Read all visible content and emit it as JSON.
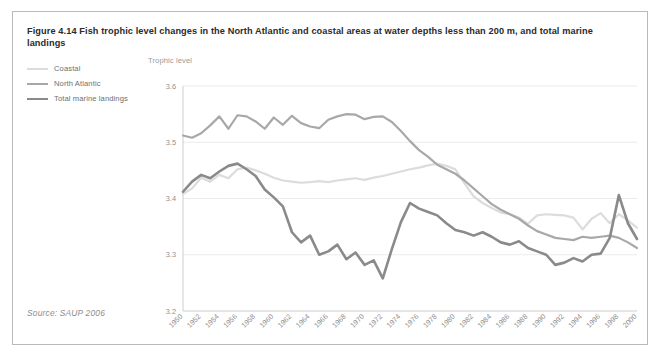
{
  "figure": {
    "title": "Figure 4.14 Fish trophic level changes in the North Atlantic and coastal areas at water depths less than 200 m, and total marine landings",
    "source": "Source: SAUP 2006"
  },
  "legend": {
    "position": "top-left-outside",
    "items": [
      {
        "label": "Coastal",
        "color": "#dcdcdc",
        "width": 2.2
      },
      {
        "label": "North Atlantic",
        "color": "#a8a8a8",
        "width": 2.2
      },
      {
        "label": "Total marine landings",
        "color": "#8a8a8a",
        "width": 2.6
      }
    ]
  },
  "chart_data": {
    "type": "line",
    "title": "Figure 4.14 Fish trophic level changes in the North Atlantic and coastal areas at water depths less than 200 m, and total marine landings",
    "xlabel": "",
    "ylabel": "Trophic level",
    "ylim": [
      3.2,
      3.6
    ],
    "yticks": [
      "3.2",
      "3.3",
      "3.4",
      "3.5",
      "3.6"
    ],
    "xlim": [
      1950,
      2000
    ],
    "grid": "horizontal",
    "legend_position": "top-left-outside",
    "x": [
      1950,
      1951,
      1952,
      1953,
      1954,
      1955,
      1956,
      1957,
      1958,
      1959,
      1960,
      1961,
      1962,
      1963,
      1964,
      1965,
      1966,
      1967,
      1968,
      1969,
      1970,
      1971,
      1972,
      1973,
      1974,
      1975,
      1976,
      1977,
      1978,
      1979,
      1980,
      1981,
      1982,
      1983,
      1984,
      1985,
      1986,
      1987,
      1988,
      1989,
      1990,
      1991,
      1992,
      1993,
      1994,
      1995,
      1996,
      1997,
      1998,
      1999,
      2000
    ],
    "xticks": [
      "1950",
      "1952",
      "1954",
      "1956",
      "1958",
      "1960",
      "1962",
      "1964",
      "1966",
      "1968",
      "1970",
      "1972",
      "1974",
      "1976",
      "1978",
      "1980",
      "1982",
      "1984",
      "1986",
      "1988",
      "1990",
      "1992",
      "1994",
      "1996",
      "1998",
      "2000"
    ],
    "series": [
      {
        "name": "Coastal",
        "color": "#dcdcdc",
        "width": 2.2,
        "values": [
          3.408,
          3.418,
          3.437,
          3.43,
          3.442,
          3.436,
          3.452,
          3.455,
          3.45,
          3.444,
          3.437,
          3.432,
          3.43,
          3.428,
          3.429,
          3.431,
          3.429,
          3.432,
          3.434,
          3.436,
          3.433,
          3.437,
          3.44,
          3.444,
          3.448,
          3.452,
          3.455,
          3.459,
          3.462,
          3.458,
          3.452,
          3.427,
          3.404,
          3.392,
          3.383,
          3.375,
          3.372,
          3.366,
          3.355,
          3.37,
          3.372,
          3.371,
          3.37,
          3.366,
          3.345,
          3.364,
          3.374,
          3.356,
          3.372,
          3.361,
          3.348
        ]
      },
      {
        "name": "North Atlantic",
        "color": "#a8a8a8",
        "width": 2.2,
        "values": [
          3.512,
          3.508,
          3.516,
          3.53,
          3.546,
          3.524,
          3.548,
          3.546,
          3.537,
          3.524,
          3.544,
          3.531,
          3.547,
          3.534,
          3.528,
          3.525,
          3.54,
          3.546,
          3.55,
          3.549,
          3.541,
          3.545,
          3.546,
          3.536,
          3.52,
          3.502,
          3.486,
          3.474,
          3.46,
          3.452,
          3.444,
          3.432,
          3.418,
          3.404,
          3.39,
          3.38,
          3.372,
          3.364,
          3.352,
          3.342,
          3.336,
          3.33,
          3.328,
          3.326,
          3.332,
          3.33,
          3.332,
          3.334,
          3.33,
          3.322,
          3.312
        ]
      },
      {
        "name": "Total marine landings",
        "color": "#8a8a8a",
        "width": 2.6,
        "values": [
          3.412,
          3.43,
          3.442,
          3.436,
          3.448,
          3.458,
          3.462,
          3.452,
          3.44,
          3.416,
          3.402,
          3.386,
          3.34,
          3.322,
          3.334,
          3.3,
          3.306,
          3.318,
          3.292,
          3.304,
          3.282,
          3.29,
          3.258,
          3.31,
          3.358,
          3.392,
          3.382,
          3.376,
          3.37,
          3.356,
          3.344,
          3.34,
          3.334,
          3.34,
          3.332,
          3.322,
          3.318,
          3.324,
          3.312,
          3.306,
          3.3,
          3.282,
          3.286,
          3.294,
          3.288,
          3.3,
          3.302,
          3.33,
          3.406,
          3.356,
          3.328
        ]
      }
    ]
  }
}
